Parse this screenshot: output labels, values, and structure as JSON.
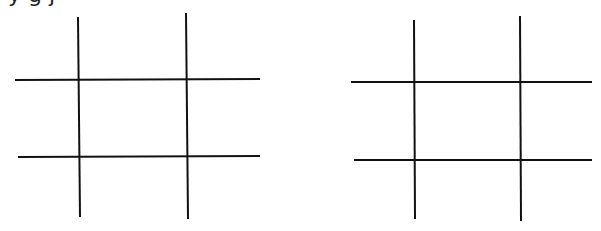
{
  "header": {
    "cut_off_text": "y g                                    j"
  },
  "diagram": {
    "stroke_color": "#111111",
    "stroke_width": 2,
    "grids": [
      {
        "name": "left-grid",
        "lines": [
          {
            "orientation": "vertical",
            "x1": 78,
            "y1": 17,
            "x2": 80,
            "y2": 217
          },
          {
            "orientation": "vertical",
            "x1": 186,
            "y1": 13,
            "x2": 188,
            "y2": 219
          },
          {
            "orientation": "horizontal",
            "x1": 15,
            "y1": 80,
            "x2": 260,
            "y2": 79
          },
          {
            "orientation": "horizontal",
            "x1": 18,
            "y1": 157,
            "x2": 260,
            "y2": 156
          }
        ]
      },
      {
        "name": "right-grid",
        "lines": [
          {
            "orientation": "vertical",
            "x1": 414,
            "y1": 20,
            "x2": 415,
            "y2": 219
          },
          {
            "orientation": "vertical",
            "x1": 520,
            "y1": 16,
            "x2": 521,
            "y2": 221
          },
          {
            "orientation": "horizontal",
            "x1": 351,
            "y1": 82,
            "x2": 592,
            "y2": 82
          },
          {
            "orientation": "horizontal",
            "x1": 354,
            "y1": 160,
            "x2": 592,
            "y2": 160
          }
        ]
      }
    ]
  }
}
